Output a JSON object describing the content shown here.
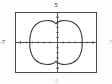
{
  "figure": {
    "name": "graphing-calculator-plot",
    "background_color": "#fdfdfd",
    "frame_color": "#4a4a4a",
    "frame_fill": "#ffffff",
    "axis_color": "#555555",
    "curve_color": "#3c3c3c"
  },
  "labels": {
    "top": "5",
    "left": "-7",
    "right": "7",
    "bottom": "-5"
  },
  "chart_data": {
    "type": "line",
    "title": "",
    "xlabel": "",
    "ylabel": "",
    "xlim": [
      -7,
      7
    ],
    "ylim": [
      -5,
      5
    ],
    "grid": false,
    "legend": "none",
    "tick_labels": {
      "x": [
        "-7",
        "7"
      ],
      "y": [
        "5",
        "-5"
      ]
    },
    "x_tick_step": 1,
    "y_tick_step": 1,
    "annotations": [],
    "series": [
      {
        "name": "closed-curve",
        "closed": true,
        "description": "closed bean/peanut shaped curve dimpled at top and bottom center",
        "x": [
          -4.6,
          -4.55,
          -4.35,
          -4.0,
          -3.5,
          -2.9,
          -2.2,
          -1.5,
          -0.9,
          -0.45,
          -0.15,
          0.0,
          0.15,
          0.45,
          0.9,
          1.5,
          2.2,
          2.9,
          3.5,
          4.0,
          4.35,
          4.55,
          4.6,
          4.55,
          4.35,
          4.0,
          3.5,
          2.9,
          2.2,
          1.5,
          0.9,
          0.45,
          0.15,
          0.0,
          -0.15,
          -0.45,
          -0.9,
          -1.5,
          -2.2,
          -2.9,
          -3.5,
          -4.0,
          -4.35,
          -4.55,
          -4.6
        ],
        "y": [
          0.0,
          0.9,
          1.75,
          2.5,
          3.05,
          3.45,
          3.65,
          3.72,
          3.66,
          3.5,
          3.3,
          3.15,
          3.3,
          3.5,
          3.66,
          3.72,
          3.65,
          3.45,
          3.05,
          2.5,
          1.75,
          0.9,
          0.0,
          -0.9,
          -1.75,
          -2.5,
          -3.05,
          -3.45,
          -3.65,
          -3.72,
          -3.66,
          -3.5,
          -3.3,
          -3.15,
          -3.3,
          -3.5,
          -3.66,
          -3.72,
          -3.65,
          -3.45,
          -3.05,
          -2.5,
          -1.75,
          -0.9,
          0.0
        ]
      }
    ]
  }
}
